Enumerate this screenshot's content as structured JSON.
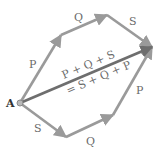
{
  "diagram": {
    "type": "vector-addition-polygon",
    "origin": {
      "label": "A",
      "x": 20,
      "y": 103
    },
    "colors": {
      "component": "#9a9a9a",
      "resultant": "#6e6e6e",
      "label": "#6a6a6a",
      "origin": "#333333"
    },
    "top_path": [
      {
        "label": "P",
        "from": [
          20,
          103
        ],
        "to": [
          61,
          35
        ],
        "label_pos": [
          31,
          66
        ]
      },
      {
        "label": "Q",
        "from": [
          61,
          35
        ],
        "to": [
          107,
          15
        ],
        "label_pos": [
          76,
          19
        ]
      },
      {
        "label": "S",
        "from": [
          107,
          15
        ],
        "to": [
          152,
          47
        ],
        "label_pos": [
          131,
          23
        ]
      }
    ],
    "bottom_path": [
      {
        "label": "S",
        "from": [
          20,
          103
        ],
        "to": [
          66,
          137
        ],
        "label_pos": [
          35,
          130
        ]
      },
      {
        "label": "Q",
        "from": [
          66,
          137
        ],
        "to": [
          113,
          115
        ],
        "label_pos": [
          88,
          143
        ]
      },
      {
        "label": "P",
        "from": [
          113,
          115
        ],
        "to": [
          152,
          47
        ],
        "label_pos": [
          137,
          92
        ]
      }
    ],
    "resultant": {
      "from": [
        20,
        103
      ],
      "to": [
        152,
        47
      ],
      "label_line1": "P + Q + S",
      "label_line2": "= S + Q + P"
    }
  }
}
